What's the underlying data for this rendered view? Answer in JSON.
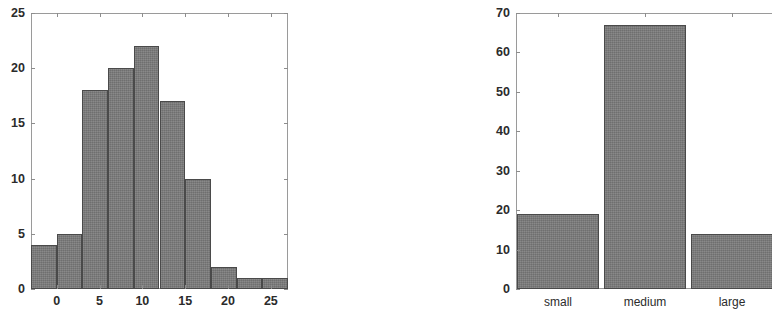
{
  "figure": {
    "background_color": "#ffffff",
    "bar_fill_color": "#7b7b7b",
    "bar_edge_color": "#4a4a4a",
    "axis_color": "#9a9a9a",
    "text_color": "#2b2b2b"
  },
  "chart_data": [
    {
      "id": "left-histogram",
      "type": "bar",
      "title": "",
      "subtitle": "",
      "xlabel": "",
      "ylabel": "",
      "orientation": "vertical",
      "grid": false,
      "legend": null,
      "legend_position": "none",
      "xlim": [
        -3,
        27
      ],
      "ylim": [
        0,
        25
      ],
      "xticks": [
        0,
        5,
        10,
        15,
        20,
        25
      ],
      "xtick_labels": [
        "0",
        "5",
        "10",
        "15",
        "20",
        "25"
      ],
      "yticks": [
        0,
        5,
        10,
        15,
        20,
        25
      ],
      "ytick_labels": [
        "0",
        "5",
        "10",
        "15",
        "20",
        "25"
      ],
      "bin_edges": [
        -3,
        0,
        3,
        6,
        9,
        12,
        15,
        18,
        21,
        24,
        27
      ],
      "bin_width": 3,
      "categories": [
        "-3 to 0",
        "0 to 3",
        "3 to 6",
        "6 to 9",
        "9 to 12",
        "12 to 15",
        "15 to 18",
        "18 to 21",
        "21 to 24",
        "24 to 27"
      ],
      "x": [
        -1.5,
        1.5,
        4.5,
        7.5,
        10.5,
        13.5,
        16.5,
        19.5,
        22.5,
        25.5
      ],
      "values": [
        4,
        5,
        18,
        20,
        22,
        17,
        10,
        2,
        1,
        1
      ]
    },
    {
      "id": "right-bar-chart",
      "type": "bar",
      "title": "",
      "subtitle": "",
      "xlabel": "",
      "ylabel": "",
      "orientation": "vertical",
      "grid": false,
      "legend": null,
      "legend_position": "none",
      "cropped_at_right_edge": true,
      "ylim": [
        0,
        70
      ],
      "yticks": [
        0,
        10,
        20,
        30,
        40,
        50,
        60,
        70
      ],
      "ytick_labels": [
        "0",
        "10",
        "20",
        "30",
        "40",
        "50",
        "60",
        "70"
      ],
      "categories": [
        "small",
        "medium",
        "large"
      ],
      "xtick_labels": [
        "small",
        "medium",
        "large"
      ],
      "values": [
        19,
        67,
        14
      ]
    }
  ]
}
